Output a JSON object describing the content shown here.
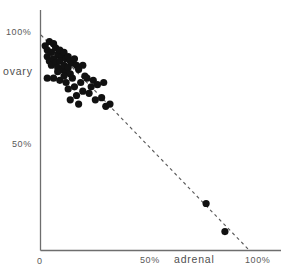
{
  "chart_data": {
    "type": "scatter",
    "title": "",
    "xlabel": "adrenal",
    "ylabel": "ovary",
    "xlim": [
      0,
      110
    ],
    "ylim": [
      0,
      112
    ],
    "grid": false,
    "legend": null,
    "x_ticks": [
      {
        "value": 0,
        "label": "0"
      },
      {
        "value": 50,
        "label": "50%"
      },
      {
        "value": 100,
        "label": "100%"
      }
    ],
    "y_ticks": [
      {
        "value": 50,
        "label": "50%"
      },
      {
        "value": 100,
        "label": "100%"
      }
    ],
    "annotations": [
      {
        "name": "reference-line",
        "style": "dashed",
        "from": [
          0,
          100
        ],
        "to": [
          100,
          0
        ],
        "note": "x + y = 100%"
      }
    ],
    "series": [
      {
        "name": "samples",
        "marker": "filled-circle",
        "color": "#111111",
        "points": [
          [
            2,
            95
          ],
          [
            3,
            93
          ],
          [
            4,
            97
          ],
          [
            3,
            90
          ],
          [
            5,
            92
          ],
          [
            6,
            96
          ],
          [
            4,
            88
          ],
          [
            7,
            94
          ],
          [
            5,
            86
          ],
          [
            8,
            91
          ],
          [
            6,
            89
          ],
          [
            9,
            93
          ],
          [
            7,
            87
          ],
          [
            10,
            90
          ],
          [
            8,
            85
          ],
          [
            11,
            92
          ],
          [
            9,
            88
          ],
          [
            12,
            89
          ],
          [
            10,
            84
          ],
          [
            13,
            90
          ],
          [
            11,
            86
          ],
          [
            14,
            88
          ],
          [
            12,
            83
          ],
          [
            15,
            87
          ],
          [
            13,
            85
          ],
          [
            16,
            89
          ],
          [
            14,
            82
          ],
          [
            17,
            86
          ],
          [
            3,
            80
          ],
          [
            6,
            80
          ],
          [
            9,
            79
          ],
          [
            12,
            78
          ],
          [
            15,
            80
          ],
          [
            18,
            84
          ],
          [
            20,
            86
          ],
          [
            13,
            75
          ],
          [
            16,
            76
          ],
          [
            19,
            78
          ],
          [
            22,
            80
          ],
          [
            25,
            79
          ],
          [
            17,
            72
          ],
          [
            20,
            74
          ],
          [
            24,
            76
          ],
          [
            27,
            77
          ],
          [
            30,
            78
          ],
          [
            14,
            70
          ],
          [
            18,
            68
          ],
          [
            26,
            70
          ],
          [
            29,
            71
          ],
          [
            31,
            67
          ],
          [
            33,
            68
          ],
          [
            23,
            73
          ],
          [
            11,
            81
          ],
          [
            8,
            83
          ],
          [
            21,
            81
          ],
          [
            79,
            22
          ],
          [
            88,
            9
          ]
        ]
      }
    ]
  },
  "axes": {
    "y": {
      "title": "ovary",
      "tick_100_label": "100%",
      "tick_50_label": "50%"
    },
    "x": {
      "title": "adrenal",
      "tick_0_label": "0",
      "tick_50_label": "50%",
      "tick_100_label": "100%"
    }
  },
  "colors": {
    "marker": "#111111",
    "axis": "#6e6e6e",
    "reference_line": "#5a5a5a",
    "text": "#595959",
    "background": "#ffffff"
  }
}
